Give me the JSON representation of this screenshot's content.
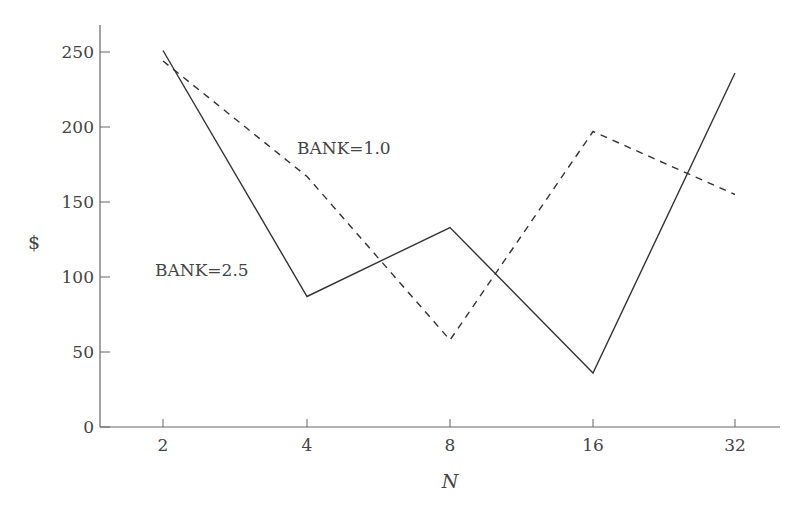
{
  "chart_data": {
    "type": "line",
    "title": "",
    "xlabel": "N",
    "ylabel": "$",
    "categories": [
      "2",
      "4",
      "8",
      "16",
      "32"
    ],
    "yticks": [
      0,
      50,
      100,
      150,
      200,
      250
    ],
    "ylim": [
      0,
      270
    ],
    "grid": false,
    "legend": "inline annotations",
    "series": [
      {
        "name": "BANK=2.5",
        "style": "solid",
        "values": [
          251,
          87,
          133,
          36,
          236
        ]
      },
      {
        "name": "BANK=1.0",
        "style": "dashed",
        "values": [
          244,
          167,
          58,
          197,
          155
        ]
      }
    ],
    "annotations": [
      {
        "text": "BANK=1.0",
        "series": "BANK=1.0"
      },
      {
        "text": "BANK=2.5",
        "series": "BANK=2.5"
      }
    ]
  },
  "colors": {
    "axis": "#666666",
    "line": "#333333",
    "text": "#444444"
  }
}
